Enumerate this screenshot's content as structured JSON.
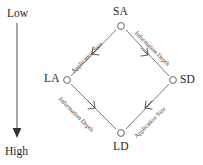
{
  "figure": {
    "type": "node-diagram",
    "shape": "diamond",
    "background_color": "#ffffff",
    "line_color": "#555555",
    "text_color": "#262626"
  },
  "scale": {
    "top_label": "Low",
    "bottom_label": "High",
    "arrow_direction": "down",
    "arrow_name": "low-to-high-arrow"
  },
  "nodes": [
    {
      "id": "SA",
      "label": "SA",
      "position": "top",
      "x": 121,
      "y": 26
    },
    {
      "id": "LA",
      "label": "LA",
      "position": "left",
      "x": 67,
      "y": 80
    },
    {
      "id": "SD",
      "label": "SD",
      "position": "right",
      "x": 173,
      "y": 80
    },
    {
      "id": "LD",
      "label": "LD",
      "position": "bottom",
      "x": 121,
      "y": 133
    }
  ],
  "edges": [
    {
      "from": "SA",
      "to": "LA",
      "label": "Application Size",
      "side": "top-left"
    },
    {
      "from": "SA",
      "to": "SD",
      "label": "Information Depth",
      "side": "top-right"
    },
    {
      "from": "LA",
      "to": "LD",
      "label": "Information Depth",
      "side": "bottom-left"
    },
    {
      "from": "SD",
      "to": "LD",
      "label": "Application Size",
      "side": "bottom-right"
    }
  ]
}
